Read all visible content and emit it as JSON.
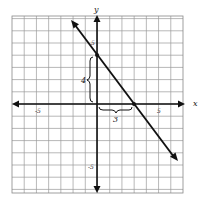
{
  "chart_data": {
    "type": "line",
    "title": "",
    "xlabel": "x",
    "ylabel": "y",
    "xlim": [
      -7,
      7
    ],
    "ylim": [
      -7,
      7
    ],
    "grid": true,
    "x_ticks_labeled": [
      "-5",
      "5"
    ],
    "y_ticks_labeled": [
      "5",
      "-5"
    ],
    "series": [
      {
        "name": "line",
        "points": [
          [
            0,
            4
          ],
          [
            3,
            0
          ]
        ],
        "slope": -1.333,
        "y_intercept": 4,
        "x_intercept": 3,
        "arrows_both_ends": true
      }
    ],
    "annotations": [
      {
        "type": "brace-vertical",
        "label": "4",
        "from": [
          0,
          0
        ],
        "to": [
          0,
          4
        ]
      },
      {
        "type": "brace-horizontal",
        "label": "3",
        "from": [
          0,
          0
        ],
        "to": [
          3,
          0
        ]
      }
    ]
  },
  "labels": {
    "x_axis": "x",
    "y_axis": "y",
    "x_neg5": "-5",
    "x_pos5": "5",
    "y_pos5": "5",
    "y_neg5": "-5",
    "rise": "4",
    "run": "3"
  }
}
